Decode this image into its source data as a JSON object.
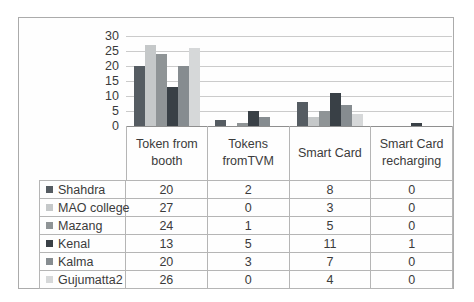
{
  "figure": {
    "background": "#fefefe",
    "border_color": "#ababab"
  },
  "chart_data": {
    "type": "bar",
    "title": "",
    "xlabel": "",
    "ylabel": "",
    "categories": [
      "Token from booth",
      "Tokens fromTVM",
      "Smart Card",
      "Smart Card recharging"
    ],
    "series": [
      {
        "name": "Shahdra",
        "color": "#555c62",
        "values": [
          20,
          2,
          8,
          0
        ]
      },
      {
        "name": "MAO college",
        "color": "#c5c8c9",
        "values": [
          27,
          0,
          3,
          0
        ]
      },
      {
        "name": "Mazang",
        "color": "#8f9496",
        "values": [
          24,
          1,
          5,
          0
        ]
      },
      {
        "name": "Kenal",
        "color": "#394046",
        "values": [
          13,
          5,
          11,
          1
        ]
      },
      {
        "name": "Kalma",
        "color": "#868c90",
        "values": [
          20,
          3,
          7,
          0
        ]
      },
      {
        "name": "Gujumatta2",
        "color": "#d6d8d9",
        "values": [
          26,
          0,
          4,
          0
        ]
      }
    ],
    "y_ticks": [
      0,
      5,
      10,
      15,
      20,
      25,
      30
    ],
    "ylim": [
      0,
      30
    ],
    "grid": true,
    "legend_position": "data-table-left",
    "axis_color": "#8f8f8f",
    "gridline_color": "#cbcbcb",
    "table_border_color": "#b5b5b5",
    "text_color": "#3b3b3b"
  }
}
